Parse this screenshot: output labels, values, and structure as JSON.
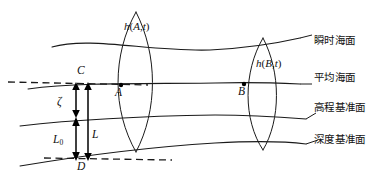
{
  "figure": {
    "kind": "vertical-datum-diagram",
    "background_color": "#ffffff",
    "ink_color": "#1a1a1a"
  },
  "surfaces": [
    {
      "id": "instantaneous-sea-surface",
      "label": "瞬时海面",
      "label_x": 311,
      "label_y": 41,
      "leader": "M 300 46 L 282 39"
    },
    {
      "id": "mean-sea-surface",
      "label": "平均海面",
      "label_x": 311,
      "label_y": 78,
      "leader": "M 300 84 L 286 84"
    },
    {
      "id": "height-datum-surface",
      "label": "高程基准面",
      "label_x": 311,
      "label_y": 108,
      "leader": "M 308 114 L 292 119"
    },
    {
      "id": "depth-datum-surface",
      "label": "深度基准面",
      "label_x": 311,
      "label_y": 140,
      "leader": "M 308 145 L 286 142"
    }
  ],
  "wave_labels": [
    {
      "id": "h-A-t",
      "function": "h",
      "open": "(",
      "arg": "A",
      "comma": ",",
      "time": "t",
      "close": ")",
      "x": 124,
      "y": 28
    },
    {
      "id": "h-B-t",
      "function": "h",
      "open": "(",
      "arg": "B",
      "comma": ",",
      "time": "t",
      "close": ")",
      "x": 256,
      "y": 65
    }
  ],
  "points": [
    {
      "id": "point-A",
      "label": "A",
      "dot_x": 121,
      "dot_y": 85,
      "label_x": 115,
      "label_y": 92
    },
    {
      "id": "point-B",
      "label": "B",
      "dot_x": 244,
      "dot_y": 84,
      "label_x": 238,
      "label_y": 91
    },
    {
      "id": "point-C",
      "label": "C",
      "dot_x": null,
      "dot_y": null,
      "label_x": 77,
      "label_y": 70
    },
    {
      "id": "point-D",
      "label": "D",
      "dot_x": null,
      "dot_y": null,
      "label_x": 77,
      "label_y": 166
    }
  ],
  "dimensions": [
    {
      "id": "zeta-dimension",
      "label": "ζ",
      "sub": "",
      "label_x": 57,
      "label_y": 102,
      "x": 76,
      "y_top": 84,
      "y_bottom": 116
    },
    {
      "id": "L0-dimension",
      "label": "L",
      "sub": "0",
      "label_x": 53,
      "label_y": 140,
      "x": 76,
      "y_top": 118,
      "y_bottom": 161
    },
    {
      "id": "L-dimension",
      "label": "L",
      "sub": "",
      "label_x": 92,
      "label_y": 135,
      "x": 88,
      "y_top": 84,
      "y_bottom": 161
    }
  ],
  "datum_dashes": [
    {
      "id": "upper-datum-dash",
      "path": "M 8 82 L 148 85"
    },
    {
      "id": "lower-datum-dash",
      "path": "M 44 158 L 172 160"
    }
  ],
  "lenses": [
    {
      "id": "lens-left",
      "cx": 136,
      "top_y": 12,
      "bottom_y": 152,
      "half_width": 18
    },
    {
      "id": "lens-right",
      "cx": 263,
      "top_y": 38,
      "bottom_y": 150,
      "half_width": 16
    }
  ]
}
